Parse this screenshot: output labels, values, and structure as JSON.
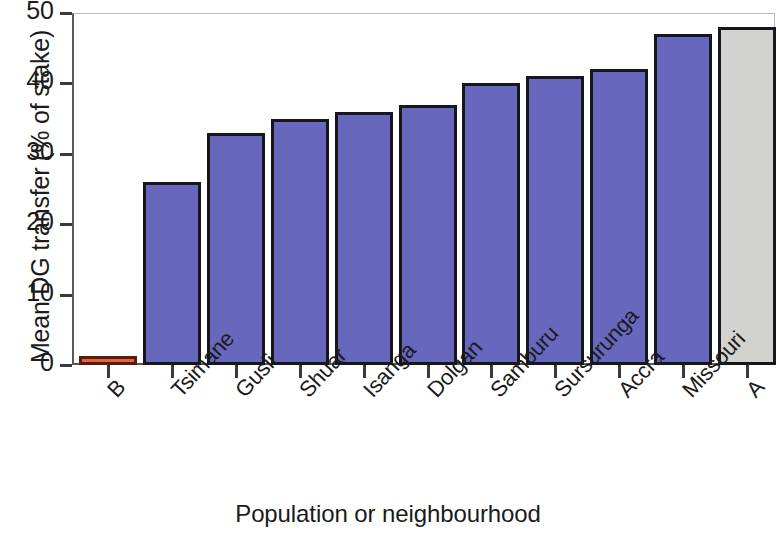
{
  "chart_data": {
    "type": "bar",
    "title": "",
    "xlabel": "Population or neighbourhood",
    "ylabel": "Mean DG transfer (% of stake)",
    "categories": [
      "B",
      "Tsimane",
      "Gusii",
      "Shuar",
      "Isanga",
      "Dolgan",
      "Samburu",
      "Sursurunga",
      "Accra",
      "Missouri",
      "A"
    ],
    "values": [
      1,
      26,
      33,
      35,
      36,
      37,
      40,
      41,
      42,
      47,
      48
    ],
    "ylim": [
      0,
      50
    ],
    "yticks": [
      0,
      10,
      20,
      30,
      40,
      50
    ],
    "ytick_labels": [
      "0",
      "10",
      "20",
      "30",
      "40",
      "50"
    ],
    "grid": false,
    "legend": "none",
    "bar_styles": [
      "orange",
      "purple",
      "purple",
      "purple",
      "purple",
      "purple",
      "purple",
      "purple",
      "purple",
      "purple",
      "grey"
    ],
    "colors": {
      "purple_fill": "#6767bd",
      "purple_edge": "#16161c",
      "orange_fill": "#e66339",
      "orange_edge": "#571d10",
      "grey_fill": "#d2d2cf",
      "grey_edge": "#16161c",
      "axis": "#3a3a3a",
      "text": "#1b1b1b"
    }
  }
}
